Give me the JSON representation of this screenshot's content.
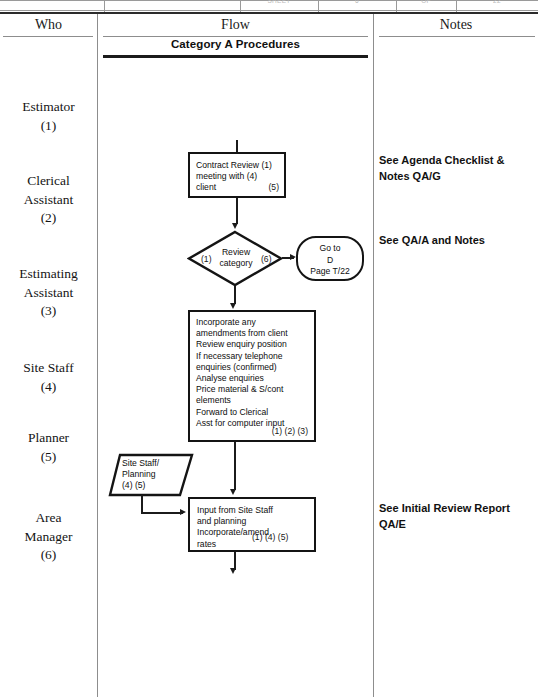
{
  "top_strip": {
    "cells": [
      {
        "label": "SHEET"
      },
      {
        "label": "6"
      },
      {
        "label": "OF"
      },
      {
        "label": "22"
      }
    ]
  },
  "columns": {
    "who_header": "Who",
    "flow_header": "Flow",
    "notes_header": "Notes"
  },
  "flow": {
    "category_title": "Category A Procedures"
  },
  "who_items": [
    {
      "name": "Estimator",
      "ref": "(1)"
    },
    {
      "name": "Clerical\nAssistant",
      "ref": "(2)"
    },
    {
      "name": "Estimating\nAssistant",
      "ref": "(3)"
    },
    {
      "name": "Site Staff",
      "ref": "(4)"
    },
    {
      "name": "Planner",
      "ref": "(5)"
    },
    {
      "name": "Area\nManager",
      "ref": "(6)"
    }
  ],
  "notes": [
    {
      "text": "See Agenda Checklist &\nNotes QA/G"
    },
    {
      "text": "See QA/A and Notes"
    },
    {
      "text": "See Initial Review\nReport QA/E"
    }
  ],
  "shapes": {
    "contract_review": {
      "body": "Contract Review (1)\nmeeting with (4)\nclient",
      "tag": "(5)"
    },
    "review_category": {
      "label": "Review\ncategory",
      "tag_left": "(1)",
      "tag_right": "(6)"
    },
    "go_to": {
      "body": "Go to\nD\nPage T/22"
    },
    "incorporate": {
      "body": "Incorporate any\namendments from client\nReview enquiry position\nIf necessary telephone\nenquiries (confirmed)\nAnalyse enquiries\nPrice material & S/cont\nelements\n Forward to Clerical\n Asst for computer input",
      "tag": "(1) (2) (3)"
    },
    "site_staff_planning": {
      "body": "Site Staff/\nPlanning\n(4) (5)"
    },
    "input_from_site": {
      "body": "Input from Site Staff\nand planning\nIncorporate/amend\nrates",
      "tag": "(1) (4) (5)"
    }
  }
}
